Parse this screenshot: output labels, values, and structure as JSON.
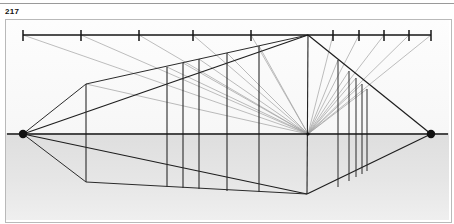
{
  "figure": {
    "number": "217",
    "caption_visible": false
  },
  "page": {
    "width": 454,
    "height": 224,
    "background_color": "#ffffff",
    "top_rule_color": "#9a9a9a"
  },
  "plate": {
    "x": 5,
    "y": 19,
    "width": 445,
    "height": 202,
    "border_color": "#b9b9b9",
    "fill_color": "#ffffff",
    "ground_shade_color": "#e3e3e3"
  },
  "diagram": {
    "type": "perspective-construction-drawing",
    "stroke_colors": {
      "heavy": "#1a1a1a",
      "medium": "#3c3c3c",
      "light": "#8c8c8c",
      "very_light": "#a8a8a8"
    },
    "horizon_line": {
      "name": "horizon-line",
      "y": 133,
      "x_start": 6,
      "x_end": 449
    },
    "measuring_line": {
      "name": "measuring-line",
      "y": 34,
      "x_start": 22,
      "x_end": 430,
      "tick_height": 9
    },
    "measuring_ticks_left": [
      22,
      80,
      138,
      192,
      250
    ],
    "measuring_ticks_right": [
      332,
      358,
      383,
      408,
      430
    ],
    "vanishing_point_left": {
      "name": "vanishing-point-left",
      "x": 22,
      "y": 133,
      "radius": 4
    },
    "vanishing_point_right": {
      "name": "vanishing-point-right",
      "x": 430,
      "y": 133,
      "radius": 4
    },
    "center_vanishing_point": {
      "name": "center-vanishing-point",
      "x": 307,
      "y": 133,
      "radius": 2
    },
    "apex_top": {
      "name": "apex-top",
      "x": 307,
      "y": 34
    },
    "apex_bottom": {
      "name": "apex-bottom",
      "x": 306,
      "y": 193
    },
    "corner_left_top": {
      "x": 85,
      "y": 83
    },
    "corner_left_bottom": {
      "x": 85,
      "y": 181
    },
    "vertical_posts_left": [
      {
        "x": 85,
        "y_top": 83,
        "y_bottom": 181
      },
      {
        "x": 166,
        "y_top": 66,
        "y_bottom": 186
      },
      {
        "x": 182,
        "y_top": 62,
        "y_bottom": 187
      },
      {
        "x": 198,
        "y_top": 58,
        "y_bottom": 188
      },
      {
        "x": 226,
        "y_top": 52,
        "y_bottom": 190
      },
      {
        "x": 258,
        "y_top": 45,
        "y_bottom": 191
      }
    ],
    "vertical_posts_right": [
      {
        "x": 337,
        "y_top": 59,
        "y_bottom": 186
      },
      {
        "x": 348,
        "y_top": 70,
        "y_bottom": 180
      },
      {
        "x": 355,
        "y_top": 77,
        "y_bottom": 176
      },
      {
        "x": 361,
        "y_top": 83,
        "y_bottom": 173
      },
      {
        "x": 366,
        "y_top": 88,
        "y_bottom": 170
      }
    ],
    "projector_count_left": 5,
    "projector_count_right": 5,
    "radial_ray_count": 11
  }
}
